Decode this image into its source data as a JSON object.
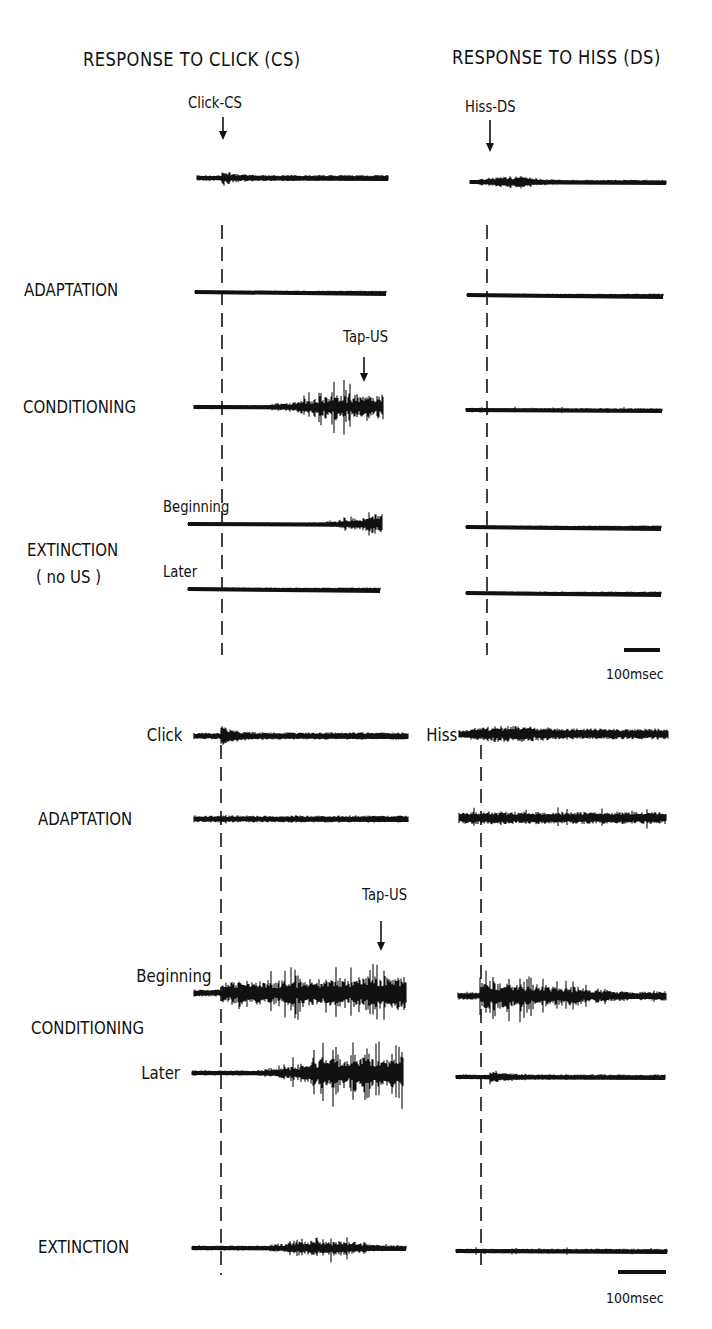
{
  "figure": {
    "column_titles": {
      "left": "RESPONSE TO CLICK (CS)",
      "right": "RESPONSE TO HISS (DS)"
    },
    "top_panel": {
      "stimulus_markers": {
        "click": "Click-CS",
        "hiss": "Hiss-DS",
        "tap": "Tap-US"
      },
      "rows": {
        "adaptation": "ADAPTATION",
        "conditioning": "CONDITIONING",
        "extinction": "EXTINCTION",
        "extinction_note": "( no US )",
        "beginning": "Beginning",
        "later": "Later"
      },
      "scale_bar": "100msec"
    },
    "bottom_panel": {
      "rows": {
        "click": "Click",
        "hiss": "Hiss",
        "adaptation": "ADAPTATION",
        "conditioning": "CONDITIONING",
        "beginning": "Beginning",
        "later": "Later",
        "extinction": "EXTINCTION"
      },
      "stimulus_markers": {
        "tap": "Tap-US"
      },
      "scale_bar": "100msec"
    }
  },
  "chart_data": {
    "type": "trace-recordings",
    "columns": [
      "RESPONSE TO CLICK (CS)",
      "RESPONSE TO HISS (DS)"
    ],
    "scale_bar_ms": 100,
    "traces": [
      {
        "id": "t1c",
        "panel": "top",
        "row": "Click-CS",
        "column": "click",
        "x0": 197,
        "x1": 388,
        "y": 178,
        "onset": 222,
        "profile": "burst-decay",
        "amp": 14,
        "noise": 2.5
      },
      {
        "id": "t1h",
        "panel": "top",
        "row": "Hiss-DS",
        "column": "hiss",
        "x0": 470,
        "x1": 666,
        "y": 182,
        "onset": 488,
        "profile": "hump",
        "amp": 10,
        "noise": 2
      },
      {
        "id": "t2c",
        "panel": "top",
        "row": "ADAPTATION",
        "column": "click",
        "x0": 195,
        "x1": 386,
        "y": 292,
        "profile": "flat",
        "amp": 0,
        "noise": 1.2
      },
      {
        "id": "t2h",
        "panel": "top",
        "row": "ADAPTATION",
        "column": "hiss",
        "x0": 467,
        "x1": 663,
        "y": 295,
        "profile": "flat",
        "amp": 0,
        "noise": 1.2
      },
      {
        "id": "t3c",
        "panel": "top",
        "row": "CONDITIONING",
        "column": "click",
        "x0": 194,
        "x1": 383,
        "y": 407,
        "onset": 260,
        "profile": "rising-spikes",
        "amp": 26,
        "noise": 1.5
      },
      {
        "id": "t3h",
        "panel": "top",
        "row": "CONDITIONING",
        "column": "hiss",
        "x0": 466,
        "x1": 662,
        "y": 410,
        "profile": "sparse",
        "amp": 4,
        "noise": 1.5
      },
      {
        "id": "t4c",
        "panel": "top",
        "row": "EXTINCTION Beginning",
        "column": "click",
        "x0": 188,
        "x1": 382,
        "y": 524,
        "onset": 300,
        "profile": "late-spikes",
        "amp": 22,
        "noise": 1.3
      },
      {
        "id": "t4h",
        "panel": "top",
        "row": "EXTINCTION Beginning",
        "column": "hiss",
        "x0": 466,
        "x1": 661,
        "y": 527,
        "profile": "flat",
        "amp": 0,
        "noise": 1.3
      },
      {
        "id": "t5c",
        "panel": "top",
        "row": "EXTINCTION Later",
        "column": "click",
        "x0": 188,
        "x1": 380,
        "y": 589,
        "profile": "flat",
        "amp": 0,
        "noise": 1.3
      },
      {
        "id": "t5h",
        "panel": "top",
        "row": "EXTINCTION Later",
        "column": "hiss",
        "x0": 466,
        "x1": 661,
        "y": 593,
        "profile": "flat",
        "amp": 0,
        "noise": 1.3
      },
      {
        "id": "b1c",
        "panel": "bottom",
        "row": "Click",
        "column": "click",
        "x0": 194,
        "x1": 408,
        "y": 736,
        "onset": 221,
        "profile": "burst-decay",
        "amp": 22,
        "noise": 3
      },
      {
        "id": "b1h",
        "panel": "bottom",
        "row": "Hiss",
        "column": "hiss",
        "x0": 459,
        "x1": 668,
        "y": 734,
        "onset": 480,
        "profile": "hump-noisy",
        "amp": 11,
        "noise": 3.5
      },
      {
        "id": "b2c",
        "panel": "bottom",
        "row": "ADAPTATION",
        "column": "click",
        "x0": 194,
        "x1": 408,
        "y": 819,
        "profile": "noisy",
        "amp": 6,
        "noise": 2.5
      },
      {
        "id": "b2h",
        "panel": "bottom",
        "row": "ADAPTATION",
        "column": "hiss",
        "x0": 459,
        "x1": 666,
        "y": 818,
        "profile": "noisy",
        "amp": 12,
        "noise": 4
      },
      {
        "id": "b3c",
        "panel": "bottom",
        "row": "CONDITIONING Beginning",
        "column": "click",
        "x0": 194,
        "x1": 406,
        "y": 993,
        "onset": 222,
        "profile": "dense-spikes",
        "amp": 34,
        "noise": 3
      },
      {
        "id": "b3h",
        "panel": "bottom",
        "row": "CONDITIONING Beginning",
        "column": "hiss",
        "x0": 458,
        "x1": 666,
        "y": 996,
        "onset": 480,
        "profile": "decaying-spikes",
        "amp": 28,
        "noise": 3
      },
      {
        "id": "b4c",
        "panel": "bottom",
        "row": "CONDITIONING Later",
        "column": "click",
        "x0": 192,
        "x1": 403,
        "y": 1073,
        "onset": 250,
        "profile": "rising-spikes",
        "amp": 32,
        "noise": 2
      },
      {
        "id": "b4h",
        "panel": "bottom",
        "row": "CONDITIONING Later",
        "column": "hiss",
        "x0": 456,
        "x1": 665,
        "y": 1077,
        "onset": 490,
        "profile": "small-burst",
        "amp": 12,
        "noise": 2
      },
      {
        "id": "b5c",
        "panel": "bottom",
        "row": "EXTINCTION",
        "column": "click",
        "x0": 192,
        "x1": 406,
        "y": 1248,
        "onset": 270,
        "profile": "mid-spikes",
        "amp": 14,
        "noise": 2
      },
      {
        "id": "b5h",
        "panel": "bottom",
        "row": "EXTINCTION",
        "column": "hiss",
        "x0": 456,
        "x1": 667,
        "y": 1251,
        "profile": "sparse",
        "amp": 4,
        "noise": 2
      }
    ],
    "stimulus_lines": [
      {
        "panel": "top",
        "x": 222,
        "y0": 225,
        "y1": 655
      },
      {
        "panel": "top",
        "x": 487,
        "y0": 225,
        "y1": 655
      },
      {
        "panel": "bottom",
        "x": 221,
        "y0": 745,
        "y1": 1275
      },
      {
        "panel": "bottom",
        "x": 481,
        "y0": 745,
        "y1": 1272
      }
    ],
    "arrows": [
      {
        "label": "Click-CS",
        "x": 223,
        "y0": 117,
        "y1": 140
      },
      {
        "label": "Hiss-DS",
        "x": 490,
        "y0": 120,
        "y1": 152
      },
      {
        "label": "Tap-US",
        "x": 364,
        "y0": 357,
        "y1": 382
      },
      {
        "label": "Tap-US",
        "x": 381,
        "y0": 921,
        "y1": 951
      }
    ],
    "scale_bars": [
      {
        "x0": 624,
        "x1": 660,
        "y": 650,
        "label": "100msec"
      },
      {
        "x0": 618,
        "x1": 666,
        "y": 1272,
        "label": "100msec"
      }
    ]
  }
}
